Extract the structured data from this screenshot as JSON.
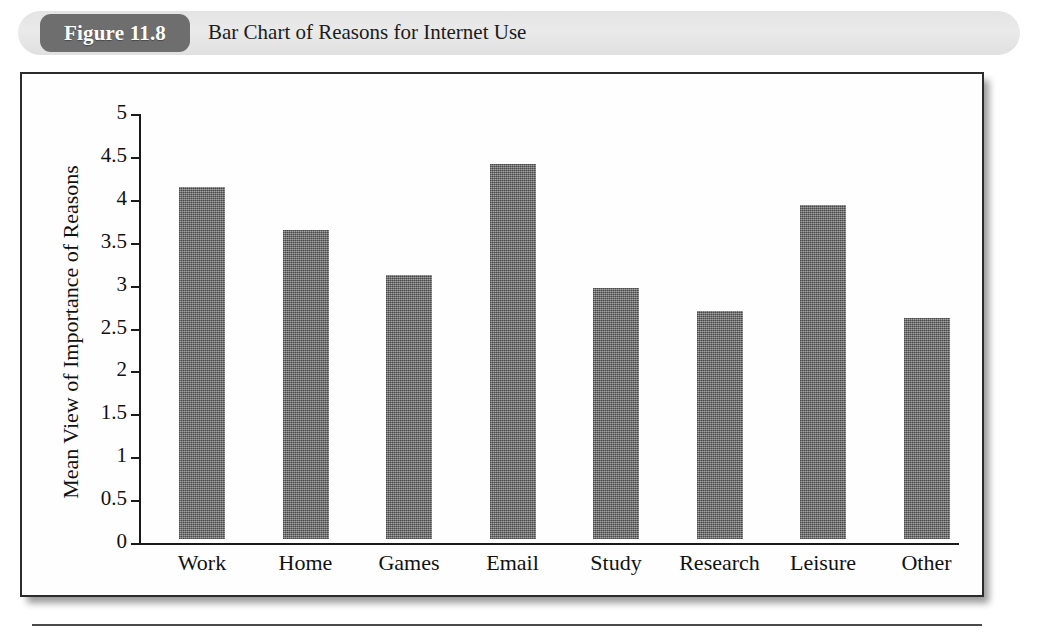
{
  "figure": {
    "badge_label": "Figure 11.8",
    "caption": "Bar Chart of Reasons for Internet Use"
  },
  "colors": {
    "badge_background": "#6e6e6e",
    "header_band": "#e6e6e6",
    "bar_fill": "#777777",
    "axis": "#1a1a1a",
    "frame_border": "#2b2b2b"
  },
  "chart_data": {
    "type": "bar",
    "title": "Bar Chart of Reasons for Internet Use",
    "xlabel": "",
    "ylabel": "Mean View of Importance of Reasons",
    "ylim": [
      0,
      5
    ],
    "ytick_labels": [
      "0",
      "0.5",
      "1",
      "1.5",
      "2",
      "2.5",
      "3",
      "3.5",
      "4",
      "4.5",
      "5"
    ],
    "ytick_values": [
      0,
      0.5,
      1,
      1.5,
      2,
      2.5,
      3,
      3.5,
      4,
      4.5,
      5
    ],
    "grid": false,
    "legend": "none",
    "categories": [
      "Work",
      "Home",
      "Games",
      "Email",
      "Study",
      "Research",
      "Leisure",
      "Other"
    ],
    "values": [
      4.1,
      3.6,
      3.08,
      4.37,
      2.92,
      2.66,
      3.89,
      2.58
    ]
  }
}
